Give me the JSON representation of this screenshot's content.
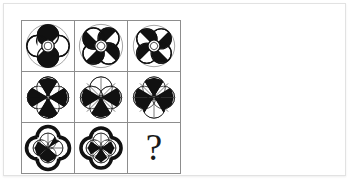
{
  "card": {
    "background_color": "#ffffff",
    "border_color": "#e2e2e2"
  },
  "matrix": {
    "rows": 3,
    "columns": 3,
    "grid_line_color": "#8d8d8d",
    "ink_color": "#111111",
    "cells": [
      {
        "id": "cell-r1c1",
        "position": "row 1, column 1",
        "figure_name": "quatrefoil-four-petal-halved",
        "description": "Four-petal quatrefoil with thin double outline; each petal split into black and white halves; small white circle at center",
        "petals": 4,
        "outline": "thin-double-ring",
        "center": "small-white-circle",
        "fill_pattern": "half-black-half-white-petals"
      },
      {
        "id": "cell-r1c2",
        "position": "row 1, column 2",
        "figure_name": "quatrefoil-four-petal-halved-rotated",
        "description": "Four-petal quatrefoil rotated 45 degrees with thin double outline; petals split black and white; small white circle at center",
        "petals": 4,
        "outline": "thin-double-ring",
        "center": "small-white-circle",
        "fill_pattern": "half-black-half-white-petals"
      },
      {
        "id": "cell-r1c3",
        "position": "row 1, column 3",
        "figure_name": "quatrefoil-four-petal-halved-variant",
        "description": "Four-petal quatrefoil with thin double outline; petals split black and white in alternating orientation; small white circle at center",
        "petals": 4,
        "outline": "thin-double-ring",
        "center": "small-white-circle",
        "fill_pattern": "half-black-half-white-petals"
      },
      {
        "id": "cell-r2c1",
        "position": "row 2, column 1",
        "figure_name": "four-circle-pinwheel-eight-wedge",
        "description": "Four overlapping thin circles forming an eight-wedge pinwheel; lower-left and lower-right sectors filled black",
        "petals": 4,
        "outline": "thin-single-circles",
        "center": "wedge-hub",
        "fill_pattern": "eight-wedge-alternating-black"
      },
      {
        "id": "cell-r2c2",
        "position": "row 2, column 2",
        "figure_name": "four-circle-pinwheel-eight-wedge-lower-black",
        "description": "Four overlapping thin circles forming an eight-wedge pinwheel; bottom half wedges filled black",
        "petals": 4,
        "outline": "thin-single-circles",
        "center": "wedge-hub",
        "fill_pattern": "eight-wedge-lower-black"
      },
      {
        "id": "cell-r2c3",
        "position": "row 2, column 3",
        "figure_name": "four-circle-pinwheel-eight-wedge-mixed",
        "description": "Four overlapping thin circles forming an eight-wedge pinwheel; left-lower and right-lower wedges filled black",
        "petals": 4,
        "outline": "thin-single-circles",
        "center": "wedge-hub",
        "fill_pattern": "eight-wedge-mixed-black"
      },
      {
        "id": "cell-r3c1",
        "position": "row 3, column 1",
        "figure_name": "bold-quatrefoil-with-inner-pinwheel",
        "description": "Thick black quatrefoil outline enclosing a thin four-circle pinwheel with partly black wedges",
        "petals": 4,
        "outline": "thick-quatrefoil",
        "center": "inner-pinwheel",
        "fill_pattern": "inner-wedges-partly-black"
      },
      {
        "id": "cell-r3c2",
        "position": "row 3, column 2",
        "figure_name": "bold-quatrefoil-with-inner-pinwheel-variant",
        "description": "Thick black quatrefoil outline enclosing a thin four-circle pinwheel with alternating black wedges",
        "petals": 4,
        "outline": "thick-quatrefoil",
        "center": "inner-pinwheel",
        "fill_pattern": "inner-wedges-alternating-black"
      },
      {
        "id": "cell-r3c3",
        "position": "row 3, column 3",
        "figure_name": "question-mark",
        "description": "Missing tile indicated by a question mark",
        "label": "?"
      }
    ]
  }
}
